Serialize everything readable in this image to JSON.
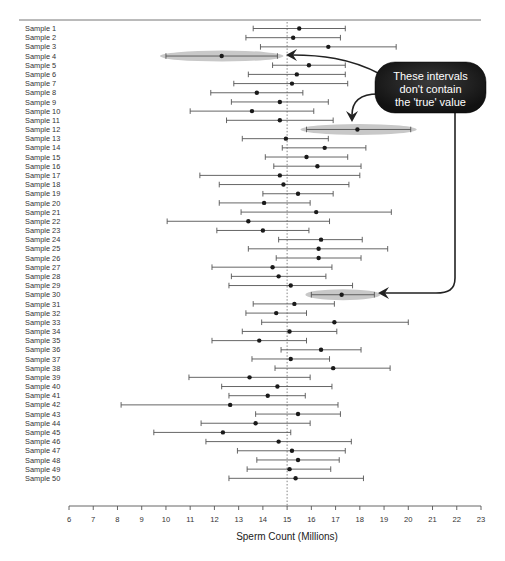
{
  "chart_data": {
    "type": "scatter",
    "subtype": "confidence-interval-forest-plot",
    "title": "",
    "xlabel": "Sperm Count (Millions)",
    "ylabel": "",
    "xlim": [
      6,
      23
    ],
    "xticks": [
      6,
      7,
      8,
      9,
      10,
      11,
      12,
      13,
      14,
      15,
      16,
      17,
      18,
      19,
      20,
      21,
      22,
      23
    ],
    "reference_line": {
      "x": 15,
      "style": "dotted",
      "meaning": "true value"
    },
    "grid": false,
    "legend": null,
    "series": [
      {
        "name": "Sample 1",
        "mean": 15.5,
        "lower": 13.6,
        "upper": 17.4
      },
      {
        "name": "Sample 2",
        "mean": 15.25,
        "lower": 13.3,
        "upper": 17.2
      },
      {
        "name": "Sample 3",
        "mean": 16.7,
        "lower": 13.9,
        "upper": 19.5
      },
      {
        "name": "Sample 4",
        "mean": 12.3,
        "lower": 10.0,
        "upper": 14.6,
        "highlight": true
      },
      {
        "name": "Sample 5",
        "mean": 15.9,
        "lower": 14.4,
        "upper": 17.4
      },
      {
        "name": "Sample 6",
        "mean": 15.4,
        "lower": 13.4,
        "upper": 17.4
      },
      {
        "name": "Sample 7",
        "mean": 15.2,
        "lower": 12.8,
        "upper": 17.5
      },
      {
        "name": "Sample 8",
        "mean": 13.75,
        "lower": 11.85,
        "upper": 15.65
      },
      {
        "name": "Sample 9",
        "mean": 14.7,
        "lower": 12.7,
        "upper": 16.7
      },
      {
        "name": "Sample 10",
        "mean": 13.55,
        "lower": 11.0,
        "upper": 16.1
      },
      {
        "name": "Sample 11",
        "mean": 14.7,
        "lower": 12.5,
        "upper": 16.9
      },
      {
        "name": "Sample 12",
        "mean": 17.9,
        "lower": 15.8,
        "upper": 20.1,
        "highlight": true
      },
      {
        "name": "Sample 13",
        "mean": 14.95,
        "lower": 13.15,
        "upper": 16.7
      },
      {
        "name": "Sample 14",
        "mean": 16.55,
        "lower": 14.8,
        "upper": 18.25
      },
      {
        "name": "Sample 15",
        "mean": 15.8,
        "lower": 14.1,
        "upper": 17.5
      },
      {
        "name": "Sample 16",
        "mean": 16.25,
        "lower": 14.45,
        "upper": 18.05
      },
      {
        "name": "Sample 17",
        "mean": 14.7,
        "lower": 11.4,
        "upper": 18.0
      },
      {
        "name": "Sample 18",
        "mean": 14.85,
        "lower": 12.2,
        "upper": 17.55
      },
      {
        "name": "Sample 19",
        "mean": 15.45,
        "lower": 14.0,
        "upper": 16.9
      },
      {
        "name": "Sample 20",
        "mean": 14.05,
        "lower": 12.2,
        "upper": 15.95
      },
      {
        "name": "Sample 21",
        "mean": 16.2,
        "lower": 13.1,
        "upper": 19.3
      },
      {
        "name": "Sample 22",
        "mean": 13.4,
        "lower": 10.05,
        "upper": 16.75
      },
      {
        "name": "Sample 23",
        "mean": 14.0,
        "lower": 12.1,
        "upper": 15.9
      },
      {
        "name": "Sample 24",
        "mean": 16.4,
        "lower": 14.65,
        "upper": 18.1
      },
      {
        "name": "Sample 25",
        "mean": 16.3,
        "lower": 13.4,
        "upper": 19.15
      },
      {
        "name": "Sample 26",
        "mean": 16.3,
        "lower": 14.55,
        "upper": 18.05
      },
      {
        "name": "Sample 27",
        "mean": 14.4,
        "lower": 11.9,
        "upper": 16.85
      },
      {
        "name": "Sample 28",
        "mean": 14.65,
        "lower": 12.7,
        "upper": 16.6
      },
      {
        "name": "Sample 29",
        "mean": 15.15,
        "lower": 12.6,
        "upper": 17.7
      },
      {
        "name": "Sample 30",
        "mean": 17.25,
        "lower": 16.0,
        "upper": 18.6,
        "highlight": true
      },
      {
        "name": "Sample 31",
        "mean": 15.3,
        "lower": 13.6,
        "upper": 16.95
      },
      {
        "name": "Sample 32",
        "mean": 14.55,
        "lower": 13.3,
        "upper": 15.8
      },
      {
        "name": "Sample 33",
        "mean": 16.95,
        "lower": 13.95,
        "upper": 20.0
      },
      {
        "name": "Sample 34",
        "mean": 15.1,
        "lower": 13.15,
        "upper": 17.05
      },
      {
        "name": "Sample 35",
        "mean": 13.85,
        "lower": 11.9,
        "upper": 15.8
      },
      {
        "name": "Sample 36",
        "mean": 16.4,
        "lower": 14.75,
        "upper": 18.05
      },
      {
        "name": "Sample 37",
        "mean": 15.15,
        "lower": 13.55,
        "upper": 16.75
      },
      {
        "name": "Sample 38",
        "mean": 16.9,
        "lower": 14.5,
        "upper": 19.25
      },
      {
        "name": "Sample 39",
        "mean": 13.45,
        "lower": 10.95,
        "upper": 15.95
      },
      {
        "name": "Sample 40",
        "mean": 14.6,
        "lower": 12.3,
        "upper": 16.85
      },
      {
        "name": "Sample 41",
        "mean": 14.2,
        "lower": 12.6,
        "upper": 15.75
      },
      {
        "name": "Sample 42",
        "mean": 12.65,
        "lower": 8.15,
        "upper": 17.1
      },
      {
        "name": "Sample 43",
        "mean": 15.45,
        "lower": 13.7,
        "upper": 17.2
      },
      {
        "name": "Sample 44",
        "mean": 13.7,
        "lower": 11.45,
        "upper": 15.95
      },
      {
        "name": "Sample 45",
        "mean": 12.35,
        "lower": 9.5,
        "upper": 15.15
      },
      {
        "name": "Sample 46",
        "mean": 14.65,
        "lower": 11.65,
        "upper": 17.65
      },
      {
        "name": "Sample 47",
        "mean": 15.2,
        "lower": 12.95,
        "upper": 17.4
      },
      {
        "name": "Sample 48",
        "mean": 15.45,
        "lower": 13.75,
        "upper": 17.15
      },
      {
        "name": "Sample 49",
        "mean": 15.1,
        "lower": 13.35,
        "upper": 16.8
      },
      {
        "name": "Sample 50",
        "mean": 15.35,
        "lower": 12.6,
        "upper": 18.15
      }
    ],
    "annotations": [
      {
        "text_lines": [
          "These intervals",
          "don't contain",
          "the 'true' value"
        ],
        "points_to": [
          "Sample 4",
          "Sample 12",
          "Sample 30"
        ]
      }
    ]
  },
  "callout": {
    "line1": "These intervals",
    "line2": "don't contain",
    "line3": "the 'true' value"
  },
  "axis": {
    "xlabel": "Sperm Count (Millions)"
  },
  "colors": {
    "interval_line": "#555555",
    "point": "#1a1a1a",
    "highlight": "#c8c8c8",
    "callout_bg": "#1c1c1c",
    "callout_text": "#ffffff",
    "reference_line": "#777777",
    "axis": "#555555"
  }
}
